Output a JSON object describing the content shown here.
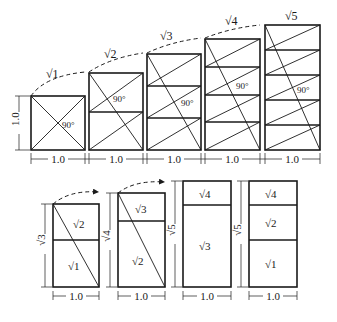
{
  "top_row": {
    "rects": [
      {
        "label": "√1",
        "angle": "90°",
        "width": "1.0",
        "height": "1.0"
      },
      {
        "label": "√2",
        "angle": "90°",
        "width": "1.0"
      },
      {
        "label": "√3",
        "angle": "90°",
        "width": "1.0"
      },
      {
        "label": "√4",
        "angle": "90°",
        "width": "1.0"
      },
      {
        "label": "√5",
        "angle": "90°",
        "width": "1.0"
      }
    ],
    "height_label": "1.0"
  },
  "bottom_row": {
    "rects": [
      {
        "height_label": "√3",
        "width": "1.0",
        "parts": [
          "√2",
          "√1"
        ]
      },
      {
        "height_label": "√4",
        "width": "1.0",
        "parts": [
          "√3",
          "√2"
        ]
      },
      {
        "height_label": "√5",
        "width": "1.0",
        "parts": [
          "√4",
          "√3"
        ]
      },
      {
        "height_label": "√5",
        "width": "1.0",
        "parts": [
          "√4",
          "√2",
          "√1"
        ]
      }
    ]
  }
}
